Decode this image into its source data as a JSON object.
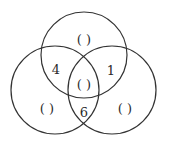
{
  "diagram": {
    "type": "venn",
    "stroke_color": "#333333",
    "background": "#ffffff",
    "circles": [
      {
        "name": "top",
        "cx": 84,
        "cy": 55,
        "r": 43
      },
      {
        "name": "left",
        "cx": 55,
        "cy": 90,
        "r": 44
      },
      {
        "name": "right",
        "cx": 112,
        "cy": 90,
        "r": 44
      }
    ],
    "regions": {
      "top_only": "( )",
      "top_left": "4",
      "top_right": "1",
      "center": "( )",
      "left_only": "( )",
      "left_right": "6",
      "right_only": "( )"
    }
  }
}
